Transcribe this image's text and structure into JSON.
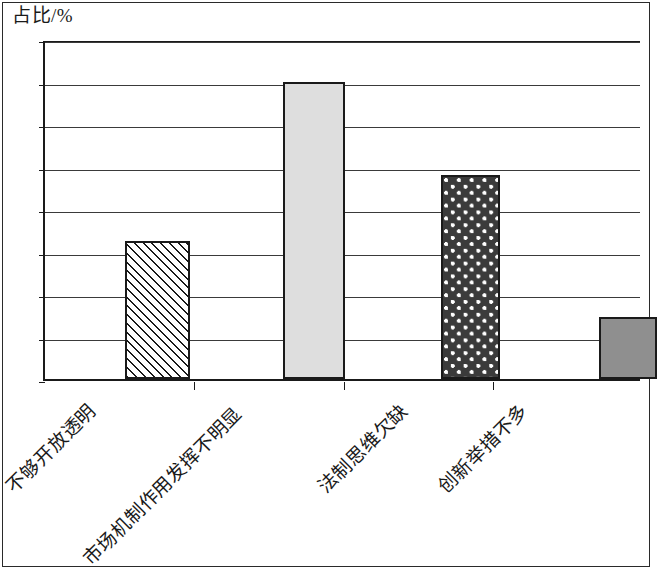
{
  "chart_data": {
    "type": "bar",
    "title": "",
    "subtitle": "",
    "xlabel": "",
    "ylabel": "占比/%",
    "ylim": [
      0,
      40
    ],
    "ytick_step": 5,
    "yticks": [
      "40",
      "35",
      "30",
      "25",
      "20",
      "15",
      "10",
      "5",
      "0"
    ],
    "grid": true,
    "legend": "none",
    "categories": [
      "不够开放透明",
      "市场机制作用发挥不明显",
      "法制思维欠缺",
      "创新举措不多"
    ],
    "values": [
      16.2,
      34.9,
      24.0,
      7.3
    ],
    "bar_fills": [
      "diagonal-hatch",
      "light-gray-solid",
      "dark-dotted",
      "medium-gray-solid"
    ],
    "colors": {
      "axis": "#1a1a1a",
      "gridline": "#3a3a3a",
      "bar_light_gray": "#dedede",
      "bar_dark_dotted": "#3b3b3b",
      "bar_medium_gray": "#8f8f8f",
      "background": "#ffffff"
    }
  }
}
